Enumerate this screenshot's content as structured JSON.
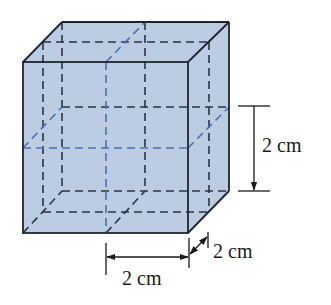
{
  "figure": {
    "type": "cube-subdivided",
    "colors": {
      "fill": "#bccde3",
      "edge": "#1f2530",
      "hidden_edge": "#2a3446",
      "mid_plane": "#4a72b0",
      "dimension": "#1a1a1a"
    }
  },
  "dimensions": {
    "height_label": "2 cm",
    "width_label": "2 cm",
    "depth_label": "2 cm"
  }
}
